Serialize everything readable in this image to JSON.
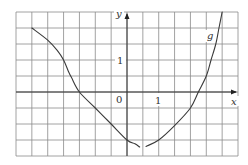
{
  "chart_data": {
    "type": "line",
    "title": "",
    "xlabel": "x",
    "ylabel": "y",
    "xlim": [
      -3.5,
      3.5
    ],
    "ylim": [
      -2,
      2.5
    ],
    "grid": true,
    "grid_step": 0.5,
    "origin_label": "0",
    "x_tick_labels": [
      {
        "value": 1,
        "label": "1"
      }
    ],
    "y_tick_labels": [
      {
        "value": 1,
        "label": "1"
      }
    ],
    "legend": null,
    "annotations": [
      {
        "text": "g",
        "x": 2.6,
        "y": 1.75,
        "italic": true
      }
    ],
    "series": [
      {
        "name": "g",
        "segments": [
          {
            "points": [
              [
                -3,
                2
              ],
              [
                -2.5,
                1.62
              ],
              [
                -2.2,
                1.3
              ],
              [
                -2,
                1
              ],
              [
                -1.85,
                0.65
              ],
              [
                -1.75,
                0.45
              ],
              [
                -1.5,
                0
              ],
              [
                -1,
                -0.5
              ],
              [
                -0.5,
                -1
              ],
              [
                0,
                -1.5
              ],
              [
                0.25,
                -1.62
              ],
              [
                0.4,
                -1.72
              ]
            ]
          },
          {
            "points": [
              [
                0.6,
                -1.7
              ],
              [
                1,
                -1.5
              ],
              [
                1.5,
                -1.05
              ],
              [
                2,
                -0.5
              ],
              [
                2.25,
                0
              ],
              [
                2.5,
                0.5
              ],
              [
                2.65,
                1
              ],
              [
                2.8,
                1.5
              ],
              [
                2.9,
                2
              ],
              [
                3,
                2.5
              ]
            ]
          }
        ]
      }
    ]
  },
  "labels": {
    "x_axis": "x",
    "y_axis": "y",
    "origin": "0",
    "x_one": "1",
    "y_one": "1",
    "curve_name": "g"
  }
}
